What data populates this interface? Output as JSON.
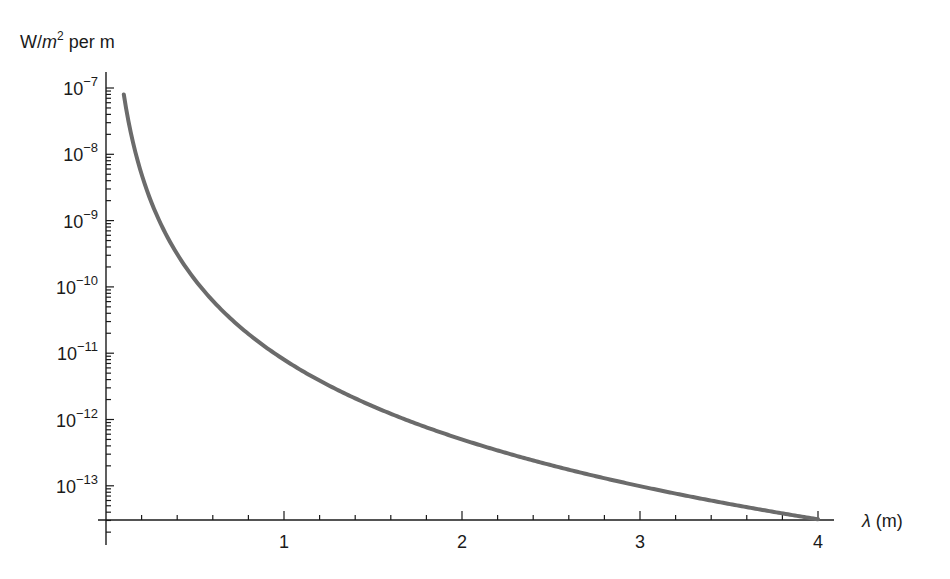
{
  "chart_data": {
    "type": "line",
    "title": "",
    "xlabel": "λ (m)",
    "ylabel": "W/m² per m",
    "ylabel_parts": {
      "prefix": "W/",
      "unit": "m",
      "sup": "2",
      "suffix": " per m"
    },
    "yscale": "log",
    "xlim": [
      0,
      4.1
    ],
    "ylim_log10": [
      -13.5,
      -6.9
    ],
    "x_ticks_major": [
      1,
      2,
      3,
      4
    ],
    "x_tick_labels": [
      "1",
      "2",
      "3",
      "4"
    ],
    "x_ticks_minor_step": 0.2,
    "y_ticks_major_log10": [
      -7,
      -8,
      -9,
      -10,
      -11,
      -12,
      -13
    ],
    "y_tick_labels": [
      {
        "base": "10",
        "exp": "−7"
      },
      {
        "base": "10",
        "exp": "−8"
      },
      {
        "base": "10",
        "exp": "−9"
      },
      {
        "base": "10",
        "exp": "−10"
      },
      {
        "base": "10",
        "exp": "−11"
      },
      {
        "base": "10",
        "exp": "−12"
      },
      {
        "base": "10",
        "exp": "−13"
      }
    ],
    "grid": false,
    "legend": null,
    "series": [
      {
        "name": "spectral irradiance",
        "color": "#6b6b6b",
        "model": "A * lambda^-4",
        "A": 8e-12,
        "x": [
          0.1,
          0.2,
          0.3,
          0.5,
          0.75,
          1.0,
          1.5,
          2.0,
          2.5,
          3.0,
          3.5,
          4.0
        ],
        "values": [
          8e-08,
          5e-09,
          9.9e-10,
          1.28e-10,
          2.5e-11,
          8e-12,
          1.6e-12,
          5e-13,
          2.05e-13,
          9.9e-14,
          5.3e-14,
          3.1e-14
        ]
      }
    ]
  },
  "layout": {
    "origin_px": [
      106,
      520
    ],
    "px_per_x_unit": 178,
    "y_px_at_log_minus7": 88,
    "px_per_decade": 66.3,
    "y_axis_top_px": 72,
    "y_axis_bottom_px": 545,
    "x_axis_right_px": 834
  }
}
